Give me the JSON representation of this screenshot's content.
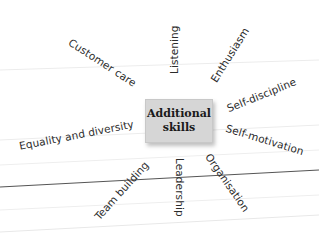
{
  "diagram": {
    "type": "spider-diagram",
    "center": {
      "line1": "Additional",
      "line2": "skills",
      "fill": "#d6d6d6"
    },
    "branches": [
      {
        "label": "Customer care"
      },
      {
        "label": "Listening"
      },
      {
        "label": "Enthusiasm"
      },
      {
        "label": "Self-discipline"
      },
      {
        "label": "Self-motivation"
      },
      {
        "label": "Organisation"
      },
      {
        "label": "Leadership"
      },
      {
        "label": "Team building"
      },
      {
        "label": "Equality and diversity"
      }
    ],
    "colors": {
      "text": "#2b2b2b",
      "background": "#ffffff",
      "rule_line": "#555555",
      "faint_rule": "#e6e6e6"
    }
  }
}
